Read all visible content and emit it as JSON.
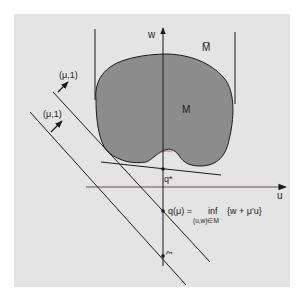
{
  "diagram": {
    "colors": {
      "background": "#e4e4e4",
      "set_fill": "#8c8c8c",
      "stroke": "#1a1a1a",
      "u_axis": "#6d4a5a"
    },
    "labels": {
      "w_axis": "w",
      "u_axis": "u",
      "closure_set": "M̅",
      "set": "M",
      "q_star": "q*",
      "normal_upper": "(μ,1)",
      "normal_lower": "(μ,1)",
      "q_mu_lhs": "q(μ) = ",
      "q_mu_inf": "inf",
      "q_mu_sub": "(u,w)∈M",
      "q_mu_rhs": "{w + μ′u}",
      "xi": "ξ"
    }
  }
}
